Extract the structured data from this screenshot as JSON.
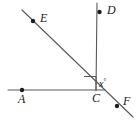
{
  "figure": {
    "stroke_color": "#58585a",
    "dot_color": "#1d1d1d",
    "text_color": "#1a1a1a",
    "background": "#ffffff",
    "points": [
      {
        "id": "E",
        "label": "E",
        "x": 33,
        "y": 21
      },
      {
        "id": "D",
        "label": "D",
        "x": 100,
        "y": 12
      },
      {
        "id": "A",
        "label": "A",
        "x": 22,
        "y": 90
      },
      {
        "id": "C",
        "label": "C",
        "x": 96,
        "y": 90
      },
      {
        "id": "F",
        "label": "F",
        "x": 117,
        "y": 106
      }
    ],
    "angle": {
      "label": "x",
      "degree_symbol": "°",
      "vertex": "C"
    },
    "right_angle_marker": {
      "present": true,
      "vertex": "C"
    },
    "lines": [
      {
        "id": "line-EF",
        "from": [
          22,
          10
        ],
        "to": [
          133,
          117
        ]
      },
      {
        "id": "ray-CD",
        "from": [
          96,
          90
        ],
        "to": [
          97,
          3
        ]
      },
      {
        "id": "line-AC",
        "from": [
          8,
          90
        ],
        "to": [
          105,
          90
        ]
      }
    ]
  }
}
